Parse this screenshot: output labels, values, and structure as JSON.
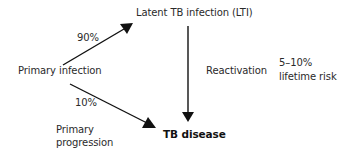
{
  "diagram": {
    "nodes": {
      "latent": "Latent TB infection (LTI)",
      "primary": "Primary infection",
      "disease": "TB disease"
    },
    "edges": {
      "to_latent_pct": "90%",
      "to_disease_pct": "10%",
      "primary_progression_line1": "Primary",
      "primary_progression_line2": "progression",
      "reactivation": "Reactivation",
      "risk_line1": "5–10%",
      "risk_line2": "lifetime risk"
    },
    "colors": {
      "arrow": "#111111",
      "text": "#2a2a2a",
      "background": "#ffffff"
    }
  }
}
